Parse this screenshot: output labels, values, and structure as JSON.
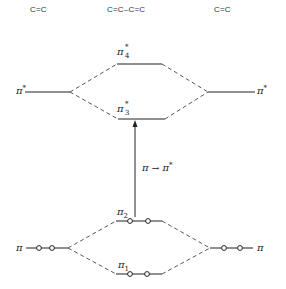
{
  "headers": {
    "left": "C=C",
    "center": "C=C–C=C",
    "right": "C=C"
  },
  "levels": {
    "left_pi_star": {
      "symbol": "π",
      "sup": "*"
    },
    "right_pi_star": {
      "symbol": "π",
      "sup": "*"
    },
    "pi4_star": {
      "symbol": "π",
      "sup": "*",
      "sub": "4"
    },
    "pi3_star": {
      "symbol": "π",
      "sup": "*",
      "sub": "3"
    },
    "pi2": {
      "symbol": "π",
      "sub": "2",
      "electrons": 2
    },
    "pi1": {
      "symbol": "π",
      "sub": "1",
      "electrons": 2
    },
    "left_pi": {
      "symbol": "π",
      "electrons": 2
    },
    "right_pi": {
      "symbol": "π",
      "electrons": 2
    }
  },
  "transition": {
    "from": "π",
    "arrow": "→",
    "to": "π",
    "to_sup": "*"
  }
}
